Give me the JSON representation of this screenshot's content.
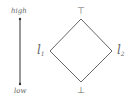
{
  "scale": {
    "high_label": "high",
    "low_label": "low"
  },
  "lattice": {
    "top_symbol": "⊤",
    "bottom_symbol": "⊥",
    "left_node": {
      "base": "l",
      "subscript": "1"
    },
    "right_node": {
      "base": "l",
      "subscript": "2"
    }
  },
  "colors": {
    "line": "#666666",
    "text": "#666666"
  }
}
